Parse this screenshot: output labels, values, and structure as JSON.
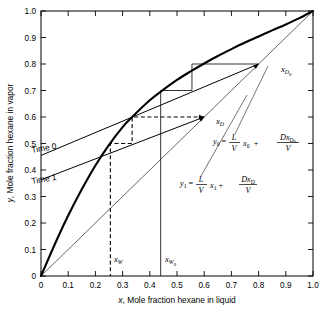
{
  "figure": {
    "kind": "mccabe-thiele-batch-distillation"
  },
  "axes": {
    "x_title": "x, Mole fraction hexane in liquid",
    "y_title": "y, Mole fraction hexane in vapor",
    "x_title_var": "x",
    "x_title_rest": ", Mole fraction hexane in liquid",
    "y_title_var": "y",
    "y_title_rest": ", Mole fraction hexane in vapor",
    "xlim": [
      0,
      1
    ],
    "ylim": [
      0,
      1
    ],
    "ticks": [
      "0",
      "0.1",
      "0.2",
      "0.3",
      "0.4",
      "0.5",
      "0.6",
      "0.7",
      "0.8",
      "0.9",
      "1.0"
    ],
    "tick_values": [
      0,
      0.1,
      0.2,
      0.3,
      0.4,
      0.5,
      0.6,
      0.7,
      0.8,
      0.9,
      1.0
    ],
    "grid": false
  },
  "chart_data": {
    "type": "line",
    "title": "",
    "xlabel": "x, Mole fraction hexane in liquid",
    "ylabel": "y, Mole fraction hexane in vapor",
    "xlim": [
      0,
      1
    ],
    "ylim": [
      0,
      1
    ],
    "grid": false,
    "legend": "none",
    "series": [
      {
        "name": "equilibrium-curve",
        "style": "solid-thick",
        "x": [
          0,
          0.05,
          0.1,
          0.15,
          0.2,
          0.25,
          0.3,
          0.335,
          0.4,
          0.45,
          0.5,
          0.55,
          0.6,
          0.65,
          0.7,
          0.75,
          0.8,
          0.85,
          0.9,
          0.95,
          1.0
        ],
        "y": [
          0,
          0.118,
          0.228,
          0.327,
          0.417,
          0.495,
          0.562,
          0.6,
          0.663,
          0.703,
          0.74,
          0.772,
          0.802,
          0.83,
          0.856,
          0.881,
          0.904,
          0.927,
          0.949,
          0.973,
          1.0
        ]
      },
      {
        "name": "diagonal-45-degree",
        "style": "solid-thin",
        "x": [
          0,
          1.0
        ],
        "y": [
          0,
          1.0
        ]
      },
      {
        "name": "operating-line-time-0",
        "style": "solid-thin",
        "x": [
          0,
          0.8
        ],
        "y": [
          0.455,
          0.8
        ],
        "intercept": 0.455,
        "slope": 0.431
      },
      {
        "name": "operating-line-time-1",
        "style": "solid-thin",
        "x": [
          0,
          0.6
        ],
        "y": [
          0.363,
          0.6
        ],
        "intercept": 0.363,
        "slope": 0.395
      },
      {
        "name": "staircase-time-0",
        "style": "solid-thin",
        "points": [
          [
            0.8,
            0.8
          ],
          [
            0.555,
            0.8
          ],
          [
            0.555,
            0.7
          ],
          [
            0.44,
            0.7
          ],
          [
            0.44,
            0.0
          ]
        ]
      },
      {
        "name": "staircase-time-1",
        "style": "dashed",
        "points": [
          [
            0.6,
            0.6
          ],
          [
            0.335,
            0.6
          ],
          [
            0.335,
            0.5
          ],
          [
            0.255,
            0.5
          ],
          [
            0.255,
            0.0
          ]
        ]
      }
    ],
    "markers": [
      {
        "name": "x_D0",
        "x": 0.8,
        "y": 0.8,
        "label": "xD0"
      },
      {
        "name": "x_D",
        "x": 0.6,
        "y": 0.6,
        "label": "xD"
      },
      {
        "name": "x_W0",
        "x": 0.44,
        "y": 0.0,
        "label": "xW0"
      },
      {
        "name": "x_W",
        "x": 0.255,
        "y": 0.0,
        "label": "xW"
      }
    ],
    "annotations": [
      {
        "name": "time-0-label",
        "text": "Time 0",
        "x": 0.09,
        "y": 0.5
      },
      {
        "name": "time-1-label",
        "text": "Time 1",
        "x": 0.09,
        "y": 0.405
      },
      {
        "name": "equation-0",
        "text": "y0 = (L/V) x0 + (D xD0)/V",
        "x": 0.62,
        "y": 0.53
      },
      {
        "name": "equation-1",
        "text": "y1 = (L/V) x1 + (D xD)/V",
        "x": 0.5,
        "y": 0.375
      }
    ]
  },
  "labels": {
    "time_0": "Time 0",
    "time_1": "Time 1",
    "xD0": {
      "base": "x",
      "sub": "D",
      "sub2": "0"
    },
    "xD": {
      "base": "x",
      "sub": "D"
    },
    "xW0": {
      "base": "x",
      "sub": "W",
      "sub2": "0"
    },
    "xW": {
      "base": "x",
      "sub": "W"
    }
  },
  "equations": {
    "eq0": {
      "lhs_var": "y",
      "lhs_sub": "0",
      "eq": "=",
      "frac1_num": "L",
      "frac1_den": "V",
      "term2_var": "x",
      "term2_sub": "0",
      "plus": "+",
      "frac2_num_d": "D",
      "frac2_num_x": "x",
      "frac2_num_sub": "D",
      "frac2_num_sub2": "0",
      "frac2_den": "V"
    },
    "eq1": {
      "lhs_var": "y",
      "lhs_sub": "1",
      "eq": "=",
      "frac1_num": "L",
      "frac1_den": "V",
      "term2_var": "x",
      "term2_sub": "1",
      "plus": "+",
      "frac2_num_d": "D",
      "frac2_num_x": "x",
      "frac2_num_sub": "D",
      "frac2_den": "V"
    }
  },
  "colors": {
    "axis": "#000000",
    "curve": "#000000",
    "line": "#000000",
    "background": "#ffffff"
  }
}
